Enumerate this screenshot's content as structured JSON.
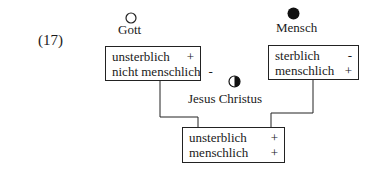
{
  "example_number": "(17)",
  "nodes": {
    "gott": {
      "label": "Gott",
      "icon": "empty-circle-icon",
      "features": [
        {
          "name": "unsterblich",
          "value": "+"
        },
        {
          "name": "nicht menschlich",
          "value": "-"
        }
      ]
    },
    "mensch": {
      "label": "Mensch",
      "icon": "filled-circle-icon",
      "features": [
        {
          "name": "sterblich",
          "value": "-"
        },
        {
          "name": "menschlich",
          "value": "+"
        }
      ]
    },
    "jesus": {
      "label": "Jesus Christus",
      "icon": "half-filled-circle-icon",
      "features": [
        {
          "name": "unsterblich",
          "value": "+"
        },
        {
          "name": "menschlich",
          "value": "+"
        }
      ]
    }
  },
  "colors": {
    "line": "#222222",
    "text": "#1a1a1a"
  }
}
